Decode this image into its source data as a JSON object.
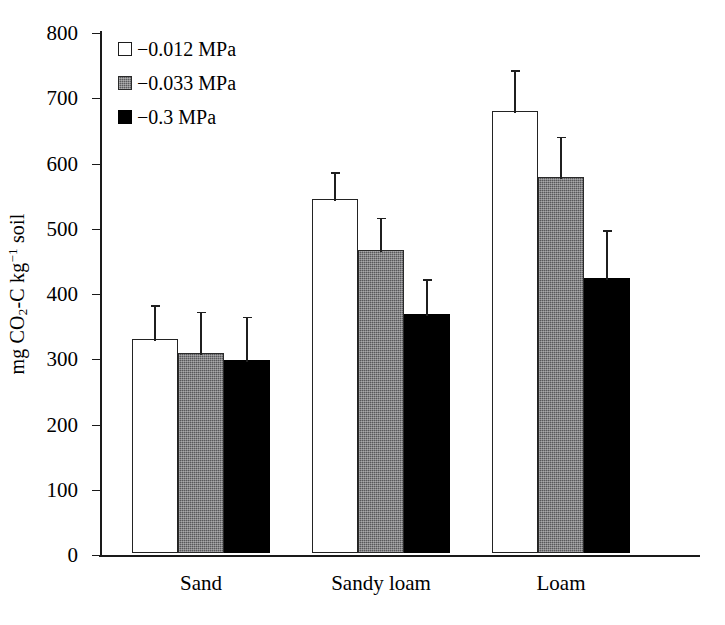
{
  "chart_data": {
    "type": "bar",
    "title": "",
    "xlabel": "",
    "ylabel": "mg CO2-C kg-1 soil",
    "ylabel_parts": {
      "prefix": "mg CO",
      "sub": "2",
      "mid": "-C kg",
      "sup": "−1",
      "suffix": " soil"
    },
    "categories": [
      "Sand",
      "Sandy loam",
      "Loam"
    ],
    "ylim": [
      0,
      800
    ],
    "yticks": [
      0,
      100,
      200,
      300,
      400,
      500,
      600,
      700,
      800
    ],
    "grid": false,
    "legend_position": "top-left",
    "series": [
      {
        "name": "−0.012 MPa",
        "fill": "white",
        "values": [
          328,
          542,
          678
        ],
        "errors": [
          55,
          45,
          65
        ]
      },
      {
        "name": "−0.033 MPa",
        "fill": "gray-stipple",
        "values": [
          307,
          465,
          576
        ],
        "errors": [
          66,
          52,
          65
        ]
      },
      {
        "name": "−0.3 MPa",
        "fill": "black",
        "values": [
          296,
          366,
          422
        ],
        "errors": [
          69,
          57,
          76
        ]
      }
    ]
  },
  "axis": {
    "tick_labels": [
      "800",
      "700",
      "600",
      "500",
      "400",
      "300",
      "200",
      "100",
      "0"
    ],
    "y_label_text": "mg CO2-C kg-1 soil"
  },
  "legend": {
    "items": [
      {
        "label": "−0.012 MPa",
        "swatch": "open-square-icon"
      },
      {
        "label": "−0.033 MPa",
        "swatch": "stippled-square-icon"
      },
      {
        "label": "−0.3 MPa",
        "swatch": "filled-square-icon"
      }
    ]
  },
  "colors": {
    "axis": "#1a1a1a",
    "bar_open": "#ffffff",
    "bar_gray": "#58585a",
    "bar_black": "#000000",
    "error_bar": "#1f1f1f"
  }
}
